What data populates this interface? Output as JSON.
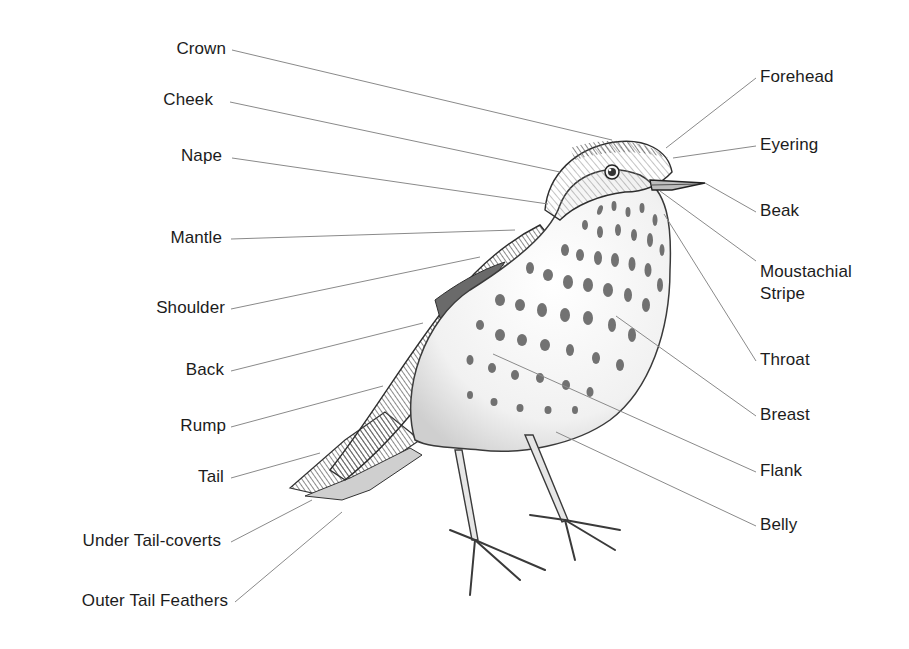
{
  "diagram": {
    "colors": {
      "text": "#1c1c1c",
      "leader_line": "#8a8a8a",
      "background": "#ffffff",
      "ink": "#3a3a3a"
    },
    "left_labels": [
      {
        "id": "crown",
        "text": "Crown",
        "x_right": 226,
        "y": 49,
        "line": [
          232,
          50,
          612,
          140
        ]
      },
      {
        "id": "cheek",
        "text": "Cheek",
        "x_right": 213,
        "y": 100,
        "line": [
          230,
          102,
          560,
          172
        ]
      },
      {
        "id": "nape",
        "text": "Nape",
        "x_right": 222,
        "y": 156,
        "line": [
          232,
          158,
          548,
          204
        ]
      },
      {
        "id": "mantle",
        "text": "Mantle",
        "x_right": 222,
        "y": 238,
        "line": [
          231,
          239,
          515,
          230
        ]
      },
      {
        "id": "shoulder",
        "text": "Shoulder",
        "x_right": 225,
        "y": 308,
        "line": [
          231,
          309,
          480,
          257
        ]
      },
      {
        "id": "back",
        "text": "Back",
        "x_right": 224,
        "y": 370,
        "line": [
          231,
          371,
          423,
          323
        ]
      },
      {
        "id": "rump",
        "text": "Rump",
        "x_right": 226,
        "y": 426,
        "line": [
          231,
          427,
          383,
          386
        ]
      },
      {
        "id": "tail",
        "text": "Tail",
        "x_right": 224,
        "y": 477,
        "line": [
          231,
          478,
          320,
          453
        ]
      },
      {
        "id": "under-tail-coverts",
        "text": "Under Tail-coverts",
        "x_right": 221,
        "y": 541,
        "line": [
          231,
          542,
          312,
          500
        ]
      },
      {
        "id": "outer-tail-feathers",
        "text": "Outer Tail Feathers",
        "x_right": 228,
        "y": 601,
        "line": [
          235,
          602,
          342,
          512
        ]
      }
    ],
    "right_labels": [
      {
        "id": "forehead",
        "text": "Forehead",
        "x_left": 760,
        "y": 77,
        "line": [
          756,
          78,
          666,
          148
        ]
      },
      {
        "id": "eyering",
        "text": "Eyering",
        "x_left": 760,
        "y": 145,
        "line": [
          756,
          146,
          673,
          158
        ]
      },
      {
        "id": "beak",
        "text": "Beak",
        "x_left": 760,
        "y": 211,
        "line": [
          756,
          212,
          705,
          183
        ]
      },
      {
        "id": "moustachial-stripe",
        "text": "Moustachial\nStripe",
        "line1": "Moustachial",
        "line2": "Stripe",
        "x_left": 760,
        "y": 272,
        "line": [
          756,
          261,
          660,
          191
        ]
      },
      {
        "id": "throat",
        "text": "Throat",
        "x_left": 760,
        "y": 360,
        "line": [
          756,
          361,
          664,
          214
        ]
      },
      {
        "id": "breast",
        "text": "Breast",
        "x_left": 760,
        "y": 415,
        "line": [
          756,
          416,
          616,
          316
        ]
      },
      {
        "id": "flank",
        "text": "Flank",
        "x_left": 760,
        "y": 471,
        "line": [
          756,
          472,
          493,
          354
        ]
      },
      {
        "id": "belly",
        "text": "Belly",
        "x_left": 760,
        "y": 525,
        "line": [
          756,
          526,
          556,
          432
        ]
      }
    ]
  }
}
